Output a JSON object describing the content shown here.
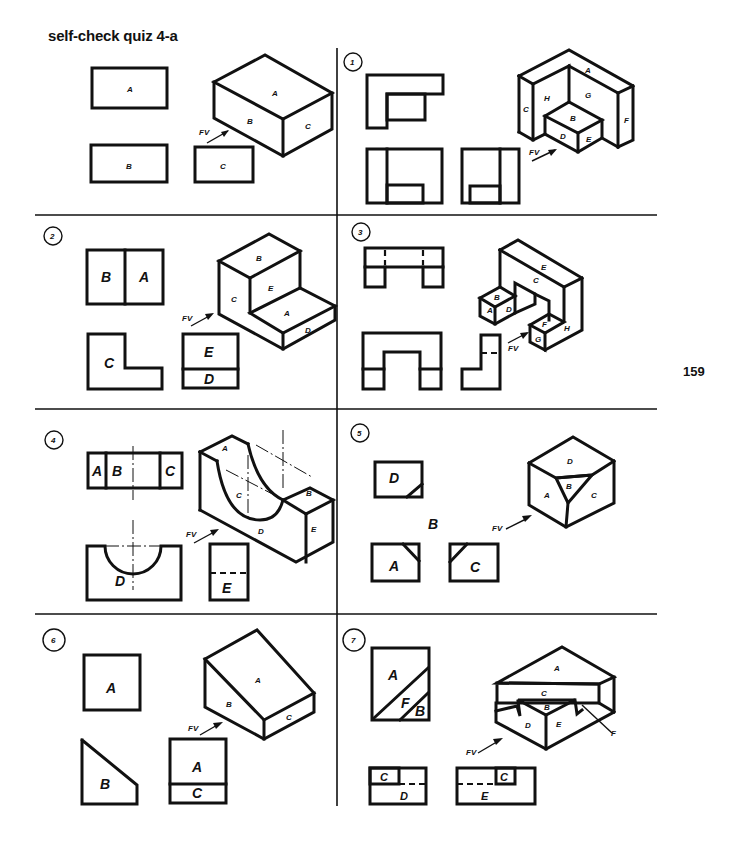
{
  "page": {
    "title": "self-check quiz 4-a",
    "page_number": "159"
  },
  "problems": [
    {
      "number": "",
      "views": {
        "top": [
          "A"
        ],
        "front": [
          "B"
        ],
        "side": [
          "C"
        ]
      },
      "pictorial_faces": [
        "A",
        "B",
        "C"
      ],
      "arrow_label": "FV"
    },
    {
      "number": "1",
      "views": {
        "top": [],
        "front": [],
        "side": []
      },
      "pictorial_faces": [
        "A",
        "B",
        "C",
        "D",
        "E",
        "F",
        "G",
        "H"
      ],
      "arrow_label": "FV"
    },
    {
      "number": "2",
      "views": {
        "top": [
          "B",
          "A"
        ],
        "front": [
          "C"
        ],
        "side": [
          "E",
          "D"
        ]
      },
      "pictorial_faces": [
        "A",
        "B",
        "C",
        "D",
        "E"
      ],
      "arrow_label": "FV"
    },
    {
      "number": "3",
      "views": {
        "top": [],
        "front": [],
        "side": []
      },
      "pictorial_faces": [
        "A",
        "B",
        "C",
        "D",
        "E",
        "F",
        "G",
        "H"
      ],
      "arrow_label": "FV"
    },
    {
      "number": "4",
      "views": {
        "top": [
          "A",
          "C",
          "B"
        ],
        "front": [
          "D"
        ],
        "side": [
          "E"
        ]
      },
      "pictorial_faces": [
        "A",
        "B",
        "C",
        "D",
        "E"
      ],
      "arrow_label": "FV"
    },
    {
      "number": "5",
      "views": {
        "top": [
          "D"
        ],
        "front": [
          "A"
        ],
        "side": [
          "C"
        ],
        "extra": [
          "B"
        ]
      },
      "pictorial_faces": [
        "A",
        "B",
        "C",
        "D"
      ],
      "arrow_label": "FV"
    },
    {
      "number": "6",
      "views": {
        "top": [
          "A"
        ],
        "front": [
          "B"
        ],
        "side": [
          "A",
          "C"
        ]
      },
      "pictorial_faces": [
        "A",
        "B",
        "C"
      ],
      "arrow_label": "FV"
    },
    {
      "number": "7",
      "views": {
        "top": [
          "A",
          "F",
          "B"
        ],
        "front": [
          "C",
          "D"
        ],
        "side": [
          "E",
          "C"
        ]
      },
      "pictorial_faces": [
        "A",
        "B",
        "C",
        "D",
        "E",
        "F"
      ],
      "arrow_label": "FV"
    }
  ]
}
